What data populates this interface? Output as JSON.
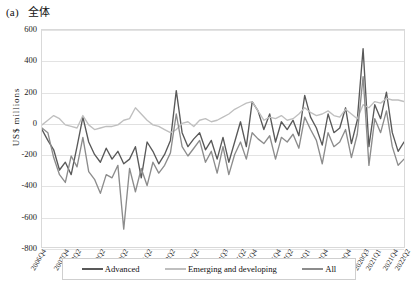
{
  "panel": {
    "tag": "(a)",
    "title": "全体"
  },
  "axes": {
    "ylabel": "US$ millions",
    "yticks": [
      "600",
      "400",
      "200",
      "0",
      "-200",
      "-400",
      "-600",
      "-800"
    ],
    "ylim": [
      -800,
      600
    ],
    "grid": true
  },
  "legend": {
    "position": "bottom",
    "items": [
      {
        "label": "Advanced",
        "color": "#595959"
      },
      {
        "label": "Emerging and developing",
        "color": "#bfbfbf"
      },
      {
        "label": "All",
        "color": "#8c8c8c"
      }
    ]
  },
  "chart_data": {
    "type": "line",
    "xlabel": "",
    "ylabel": "US$ millions",
    "ylim": [
      -800,
      600
    ],
    "ytick_step": 200,
    "grid": true,
    "legend_position": "bottom",
    "x": [
      "2006Q4",
      "2007Q1",
      "2007Q2",
      "2007Q3",
      "2007Q4",
      "2008Q1",
      "2008Q2",
      "2008Q3",
      "2008Q4",
      "2009Q1",
      "2009Q2",
      "2009Q3",
      "2009Q4",
      "2010Q1",
      "2010Q2",
      "2010Q3",
      "2010Q4",
      "2011Q1",
      "2011Q2",
      "2011Q3",
      "2011Q4",
      "2012Q1",
      "2012Q2",
      "2012Q3",
      "2012Q4",
      "2013Q1",
      "2013Q2",
      "2013Q3",
      "2013Q4",
      "2014Q1",
      "2014Q2",
      "2014Q3",
      "2014Q4",
      "2015Q1",
      "2015Q2",
      "2015Q3",
      "2015Q4",
      "2016Q1",
      "2016Q2",
      "2016Q3",
      "2016Q4",
      "2017Q1",
      "2017Q2",
      "2017Q3",
      "2017Q4",
      "2018Q1",
      "2018Q2",
      "2018Q3",
      "2018Q4",
      "2019Q1",
      "2019Q2",
      "2019Q3",
      "2019Q4",
      "2020Q1",
      "2020Q2",
      "2020Q3",
      "2020Q4",
      "2021Q1",
      "2021Q2",
      "2021Q3",
      "2021Q4",
      "2022Q1",
      "2022Q2"
    ],
    "xtick_labels": [
      {
        "index": 0,
        "label": "2006Q4"
      },
      {
        "index": 4,
        "label": "2007Q4"
      },
      {
        "index": 6,
        "label": "2008Q2"
      },
      {
        "index": 10,
        "label": "2009Q2"
      },
      {
        "index": 14,
        "label": "2010Q2"
      },
      {
        "index": 18,
        "label": "2011Q2"
      },
      {
        "index": 22,
        "label": "2012Q2"
      },
      {
        "index": 26,
        "label": "2013Q2"
      },
      {
        "index": 31,
        "label": "2014Q3"
      },
      {
        "index": 34,
        "label": "2015Q2"
      },
      {
        "index": 36,
        "label": "2015Q4"
      },
      {
        "index": 40,
        "label": "2016Q4"
      },
      {
        "index": 42,
        "label": "2017Q2"
      },
      {
        "index": 45,
        "label": "2018Q1"
      },
      {
        "index": 48,
        "label": "2018Q4"
      },
      {
        "index": 52,
        "label": "2019Q4"
      },
      {
        "index": 55,
        "label": "2020Q3"
      },
      {
        "index": 57,
        "label": "2021Q1"
      },
      {
        "index": 60,
        "label": "2021Q4"
      },
      {
        "index": 62,
        "label": "2022Q2"
      }
    ],
    "series": [
      {
        "name": "Advanced",
        "color": "#595959",
        "values": [
          -40,
          -110,
          -170,
          -300,
          -250,
          -330,
          -150,
          40,
          -120,
          -200,
          -250,
          -160,
          -230,
          -180,
          -260,
          -230,
          -150,
          -350,
          -120,
          -180,
          -260,
          -200,
          -110,
          210,
          -60,
          -150,
          -100,
          -60,
          -170,
          -110,
          -230,
          -90,
          -250,
          -120,
          10,
          -150,
          140,
          80,
          -40,
          60,
          -120,
          10,
          -40,
          20,
          -80,
          180,
          40,
          -30,
          -140,
          60,
          -60,
          -30,
          100,
          -130,
          20,
          480,
          -150,
          120,
          30,
          200,
          -60,
          -180,
          -120
        ]
      },
      {
        "name": "Emerging and developing",
        "color": "#bfbfbf",
        "values": [
          -10,
          20,
          50,
          30,
          -10,
          -20,
          -30,
          50,
          -10,
          -40,
          -30,
          -20,
          -20,
          -10,
          20,
          30,
          100,
          60,
          20,
          -10,
          -20,
          -40,
          -60,
          -40,
          0,
          10,
          -20,
          20,
          30,
          10,
          20,
          40,
          60,
          90,
          110,
          130,
          140,
          80,
          20,
          40,
          30,
          50,
          20,
          30,
          60,
          100,
          70,
          50,
          60,
          80,
          50,
          40,
          90,
          60,
          30,
          120,
          100,
          140,
          130,
          160,
          150,
          150,
          140
        ]
      },
      {
        "name": "All",
        "color": "#8c8c8c",
        "values": [
          -30,
          -60,
          -220,
          -330,
          -380,
          -210,
          -280,
          -90,
          -310,
          -360,
          -450,
          -330,
          -350,
          -270,
          -680,
          -290,
          -440,
          -290,
          -400,
          -250,
          -320,
          -270,
          -190,
          60,
          -150,
          -210,
          -160,
          -110,
          -250,
          -180,
          -320,
          -150,
          -330,
          -200,
          -120,
          -230,
          -60,
          -100,
          -130,
          -80,
          -230,
          -90,
          -120,
          -70,
          -160,
          40,
          -40,
          -110,
          -260,
          -60,
          -150,
          -120,
          -40,
          -220,
          -70,
          300,
          -270,
          30,
          -60,
          80,
          -150,
          -270,
          -230
        ]
      }
    ]
  }
}
